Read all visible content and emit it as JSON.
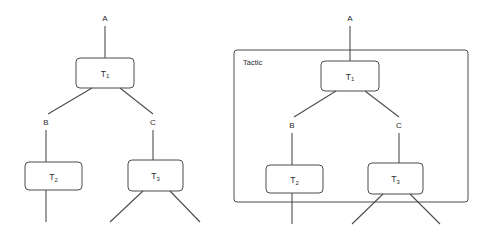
{
  "figure": {
    "title": "",
    "background_color": "#ffffff",
    "stroke_color": "#4d4d4d",
    "text_color": "#2b2b2b"
  },
  "panels": [
    {
      "id": "left-panel",
      "name": "proof-tree-plain",
      "group_label": "",
      "has_group_box": false,
      "nodes": [
        {
          "id": "t1",
          "base": "T",
          "sub": "1",
          "x": 105,
          "y": 73,
          "w": 58,
          "h": 30
        },
        {
          "id": "t2",
          "base": "T",
          "sub": "2",
          "x": 53,
          "y": 176,
          "w": 57,
          "h": 28
        },
        {
          "id": "t3",
          "base": "T",
          "sub": "3",
          "x": 155,
          "y": 176,
          "w": 55,
          "h": 32
        }
      ],
      "edge_labels": [
        {
          "id": "a",
          "text": "A",
          "x": 105,
          "y": 18
        },
        {
          "id": "b",
          "text": "B",
          "x": 46,
          "y": 122
        },
        {
          "id": "c",
          "text": "C",
          "x": 153,
          "y": 122
        }
      ]
    },
    {
      "id": "right-panel",
      "name": "proof-tree-tactic",
      "group_label": "Tactic",
      "has_group_box": true,
      "group_box": {
        "x": 234,
        "y": 50,
        "w": 234,
        "h": 152
      },
      "group_label_pos": {
        "x": 243,
        "y": 62
      },
      "nodes": [
        {
          "id": "t1",
          "base": "T",
          "sub": "1",
          "x": 350,
          "y": 76,
          "w": 58,
          "h": 30
        },
        {
          "id": "t2",
          "base": "T",
          "sub": "2",
          "x": 294,
          "y": 179,
          "w": 57,
          "h": 28
        },
        {
          "id": "t3",
          "base": "T",
          "sub": "3",
          "x": 395,
          "y": 179,
          "w": 55,
          "h": 32
        }
      ],
      "edge_labels": [
        {
          "id": "a",
          "text": "A",
          "x": 350,
          "y": 18
        },
        {
          "id": "b",
          "text": "B",
          "x": 292,
          "y": 125
        },
        {
          "id": "c",
          "text": "C",
          "x": 399,
          "y": 125
        }
      ]
    }
  ]
}
